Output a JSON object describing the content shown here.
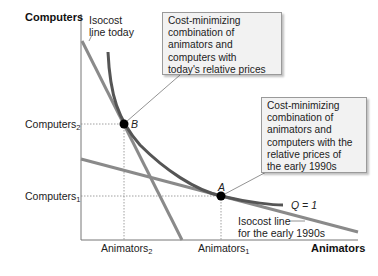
{
  "axes": {
    "y_title": "Computers",
    "x_title": "Animators"
  },
  "ticks": {
    "y": [
      {
        "base": "Computers",
        "sub": "2"
      },
      {
        "base": "Computers",
        "sub": "1"
      }
    ],
    "x": [
      {
        "base": "Animators",
        "sub": "2"
      },
      {
        "base": "Animators",
        "sub": "1"
      }
    ]
  },
  "points": {
    "B": "B",
    "A": "A"
  },
  "labels": {
    "isocost_today": [
      "Isocost",
      "line today"
    ],
    "isocost_1990s": [
      "Isocost line",
      "for the early 1990s"
    ],
    "isoquant": "Q = 1"
  },
  "callouts": {
    "today": [
      "Cost-minimizing",
      "combination of",
      "animators and",
      "computers with",
      "today's relative prices"
    ],
    "early_1990s": [
      "Cost-minimizing",
      "combination of",
      "animators and",
      "computers with the",
      "relative prices of",
      "the early 1990s"
    ]
  },
  "colors": {
    "isocost_line": "#8a8a8a",
    "isoquant": "#555555",
    "axis": "#777777",
    "point": "#000000",
    "callout_bg": "#f2f2f2"
  }
}
